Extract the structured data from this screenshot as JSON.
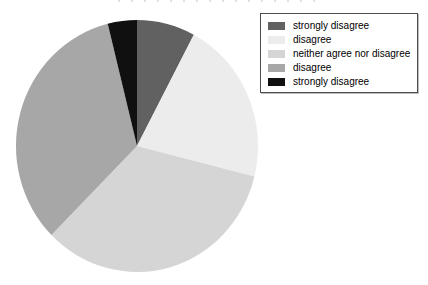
{
  "chart_data": {
    "type": "pie",
    "title": "",
    "legend_position": "upper right",
    "start_angle": "12 o'clock, clockwise",
    "slices": [
      {
        "label": "strongly disagree",
        "percent": 7.8,
        "angle_deg": 28,
        "color": "#616161"
      },
      {
        "label": "disagree",
        "percent": 21.1,
        "angle_deg": 76,
        "color": "#ececec"
      },
      {
        "label": "neither agree nor disagree",
        "percent": 33.6,
        "angle_deg": 121,
        "color": "#d5d5d5"
      },
      {
        "label": "disagree",
        "percent": 33.6,
        "angle_deg": 121,
        "color": "#a7a7a7"
      },
      {
        "label": "strongly disagree",
        "percent": 3.9,
        "angle_deg": 14,
        "color": "#101010"
      }
    ],
    "legend": {
      "border_color": "#4d4d4d",
      "background": "#ffffff",
      "text_color": "#000000"
    }
  }
}
